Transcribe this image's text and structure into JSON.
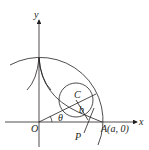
{
  "diagram": {
    "type": "geometry",
    "labels": {
      "y_axis": "y",
      "x_axis": "x",
      "origin": "O",
      "center": "C",
      "angle_theta": "θ",
      "angle_b": "b",
      "point_p": "P",
      "point_a": "A(a, 0)"
    },
    "colors": {
      "stroke": "#231f20",
      "background": "#ffffff"
    }
  }
}
